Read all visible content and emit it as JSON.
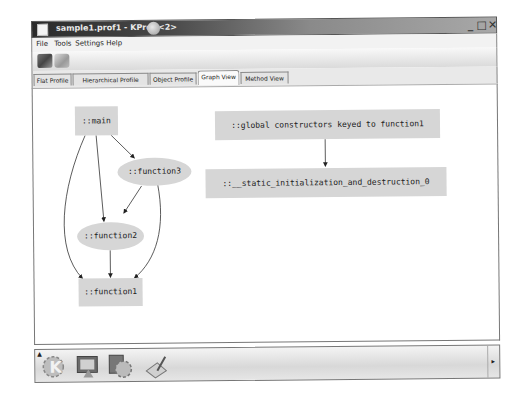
{
  "window": {
    "title": "sample1.prof1 - KProf <2>",
    "controls": {
      "minimize": "_",
      "maximize": "□",
      "close": "✕"
    }
  },
  "menubar": {
    "items": [
      {
        "label": "File"
      },
      {
        "label": "Tools"
      },
      {
        "label": "Settings"
      },
      {
        "label": "Help"
      }
    ]
  },
  "toolbar": {
    "buttons": [
      {
        "name": "open-file",
        "icon": "folder-open-icon"
      },
      {
        "name": "print",
        "icon": "printer-icon"
      }
    ]
  },
  "tabs": [
    {
      "label": "Flat Profile",
      "active": false
    },
    {
      "label": "Hierarchical Profile",
      "active": false
    },
    {
      "label": "Object Profile",
      "active": false
    },
    {
      "label": "Graph View",
      "active": true
    },
    {
      "label": "Method View",
      "active": false
    }
  ],
  "graph": {
    "nodes": [
      {
        "id": "main",
        "label": "::main",
        "shape": "box"
      },
      {
        "id": "function3",
        "label": "::function3",
        "shape": "ellipse"
      },
      {
        "id": "function2",
        "label": "::function2",
        "shape": "ellipse"
      },
      {
        "id": "function1",
        "label": "::function1",
        "shape": "box"
      },
      {
        "id": "global_ctors",
        "label": "::global constructors keyed to function1",
        "shape": "box"
      },
      {
        "id": "static_init",
        "label": "::__static_initialization_and_destruction_0",
        "shape": "box"
      }
    ],
    "edges": [
      {
        "from": "main",
        "to": "function3"
      },
      {
        "from": "main",
        "to": "function2"
      },
      {
        "from": "main",
        "to": "function1"
      },
      {
        "from": "function3",
        "to": "function2"
      },
      {
        "from": "function3",
        "to": "function1"
      },
      {
        "from": "function2",
        "to": "function1"
      },
      {
        "from": "global_ctors",
        "to": "static_init"
      }
    ],
    "node_fill": "#d6d6d6"
  },
  "taskbar": {
    "items": [
      {
        "name": "kde-menu",
        "icon": "kde-gear-icon"
      },
      {
        "name": "show-desktop",
        "icon": "desktop-icon"
      },
      {
        "name": "control-center",
        "icon": "control-center-icon"
      },
      {
        "name": "editor",
        "icon": "editor-icon"
      }
    ]
  }
}
